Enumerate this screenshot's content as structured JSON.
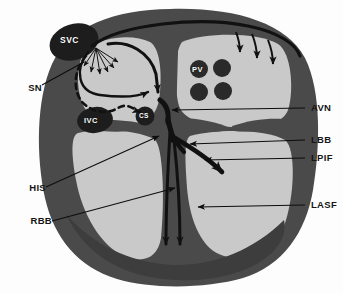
{
  "figure": {
    "background_color": "#fdfdfd"
  },
  "colors": {
    "myocardium": "#4a4a4a",
    "myocardium_dark": "#3d3d3d",
    "chamber": "#c9c9c9",
    "chamber_light": "#d2d2d2",
    "vessel_dark": "#1d1d1d",
    "conduction": "#111111",
    "leader_line": "#0d0d0d",
    "label_text": "#151515",
    "inner_label_text": "#ffffff"
  },
  "external_labels": [
    {
      "id": "SN",
      "text": "SN",
      "side": "left",
      "x": 18,
      "y": 88,
      "target_x": 84,
      "target_y": 62
    },
    {
      "id": "HIS",
      "text": "HIS",
      "side": "left",
      "x": 20,
      "y": 188,
      "target_x": 159,
      "target_y": 136
    },
    {
      "id": "RBB",
      "text": "RBB",
      "side": "left",
      "x": 20,
      "y": 221,
      "target_x": 175,
      "target_y": 188
    },
    {
      "id": "AVN",
      "text": "AVN",
      "side": "right",
      "x": 310,
      "y": 108,
      "target_x": 170,
      "target_y": 110
    },
    {
      "id": "LBB",
      "text": "LBB",
      "side": "right",
      "x": 310,
      "y": 140,
      "target_x": 188,
      "target_y": 144
    },
    {
      "id": "LPIF",
      "text": "LPIF",
      "side": "right",
      "x": 310,
      "y": 158,
      "target_x": 203,
      "target_y": 160
    },
    {
      "id": "LASF",
      "text": "LASF",
      "side": "right",
      "x": 310,
      "y": 205,
      "target_x": 196,
      "target_y": 207
    }
  ],
  "internal_labels": [
    {
      "id": "SVC",
      "text": "SVC",
      "x": 60,
      "y": 40,
      "style": "lbl-svc",
      "shape": "superior-vena-cava"
    },
    {
      "id": "IVC",
      "text": "IVC",
      "x": 86,
      "y": 119,
      "style": "lbl-ivc",
      "shape": "inferior-vena-cava"
    },
    {
      "id": "CS",
      "text": "CS",
      "x": 139,
      "y": 114,
      "style": "lbl-cs",
      "shape": "coronary-sinus"
    },
    {
      "id": "PV",
      "text": "PV",
      "x": 192,
      "y": 66,
      "style": "lbl-pv",
      "shape": "pulmonary-vein"
    }
  ],
  "anatomy": {
    "structures": [
      "right-atrium",
      "left-atrium",
      "right-ventricle",
      "left-ventricle",
      "interatrial-septum",
      "interventricular-septum",
      "tricuspid-valve-leaflet",
      "mitral-valve-leaflet",
      "superior-vena-cava",
      "inferior-vena-cava",
      "coronary-sinus",
      "pulmonary-veins"
    ],
    "conduction_paths": [
      "sinus-node-radiation-fan",
      "bachmann-bundle",
      "anterior-internodal-tract",
      "middle-internodal-tract",
      "posterior-internodal-tract-dashed",
      "av-node",
      "his-bundle",
      "right-bundle-branch",
      "left-bundle-branch",
      "left-anterior-superior-fascicle",
      "left-posterior-inferior-fascicle",
      "left-atrial-activation-arrows"
    ]
  }
}
